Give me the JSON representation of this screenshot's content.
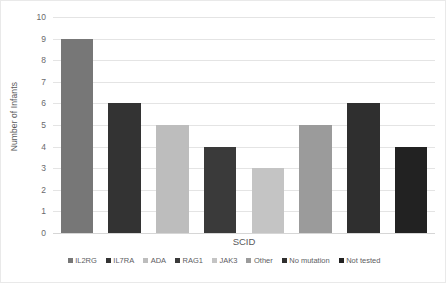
{
  "chart_data": {
    "type": "bar",
    "title": "",
    "xlabel": "SCID",
    "ylabel": "Number of Infants",
    "categories": [
      "IL2RG",
      "IL7RA",
      "ADA",
      "RAG1",
      "JAK3",
      "Other",
      "No mutation",
      "Not tested"
    ],
    "values": [
      9,
      6,
      5,
      4,
      3,
      5,
      6,
      4
    ],
    "ylim": [
      0,
      10
    ],
    "yticks": [
      "0",
      "1",
      "2",
      "3",
      "4",
      "5",
      "6",
      "7",
      "8",
      "9",
      "10"
    ],
    "grid": true,
    "legend_position": "bottom",
    "bar_colors": [
      "#777777",
      "#333333",
      "#bdbdbd",
      "#3a3a3a",
      "#c4c4c4",
      "#9b9b9b",
      "#2f2f2f",
      "#222222"
    ],
    "series": [
      {
        "name": "Number of Infants",
        "values": [
          9,
          6,
          5,
          4,
          3,
          5,
          6,
          4
        ]
      }
    ],
    "legend": [
      {
        "label": "IL2RG",
        "color": "#777777",
        "value": 9
      },
      {
        "label": "IL7RA",
        "color": "#333333",
        "value": 6
      },
      {
        "label": "ADA",
        "color": "#bdbdbd",
        "value": 5
      },
      {
        "label": "RAG1",
        "color": "#3a3a3a",
        "value": 4
      },
      {
        "label": "JAK3",
        "color": "#c4c4c4",
        "value": 3
      },
      {
        "label": "Other",
        "color": "#9b9b9b",
        "value": 5
      },
      {
        "label": "No mutation",
        "color": "#2f2f2f",
        "value": 6
      },
      {
        "label": "Not tested",
        "color": "#222222",
        "value": 4
      }
    ]
  }
}
